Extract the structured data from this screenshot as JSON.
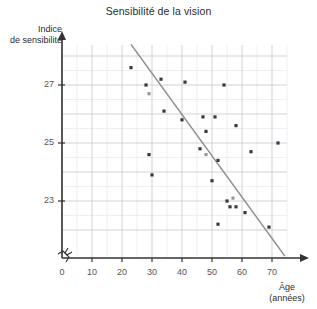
{
  "chart_data": {
    "type": "scatter",
    "title": "Sensibilité de la vision",
    "xlabel": "Âge",
    "xlabel_unit": "(années)",
    "ylabel_line1": "Indice",
    "ylabel_line2": "de sensibilité",
    "xlim": [
      0,
      75
    ],
    "ylim": [
      21.7,
      28.4
    ],
    "xticks": [
      0,
      10,
      20,
      30,
      40,
      50,
      60,
      70
    ],
    "xtick_labels": [
      "0",
      "10",
      "20",
      "30",
      "40",
      "50",
      "60",
      "70"
    ],
    "yticks": [
      23,
      25,
      27
    ],
    "ytick_labels": [
      "23",
      "25",
      "27"
    ],
    "grid": true,
    "grid_minor": true,
    "axis_break_x": true,
    "axis_break_y": true,
    "legend": null,
    "point_color": "#3a3a3a",
    "point_color_light": "#9a9a9a",
    "trendline_color": "#8c8c8c",
    "grid_major_color": "#c8c8cf",
    "grid_minor_color": "#e8e8ee",
    "axis_color": "#333333",
    "points": [
      {
        "x": 23,
        "y": 27.6
      },
      {
        "x": 28,
        "y": 27.0
      },
      {
        "x": 29,
        "y": 26.7,
        "light": true
      },
      {
        "x": 33,
        "y": 27.2
      },
      {
        "x": 34,
        "y": 26.1
      },
      {
        "x": 29,
        "y": 24.6
      },
      {
        "x": 30,
        "y": 23.9
      },
      {
        "x": 41,
        "y": 27.1
      },
      {
        "x": 40,
        "y": 25.8
      },
      {
        "x": 47,
        "y": 25.9
      },
      {
        "x": 48,
        "y": 25.4
      },
      {
        "x": 51,
        "y": 25.9
      },
      {
        "x": 54,
        "y": 27.0
      },
      {
        "x": 58,
        "y": 25.6
      },
      {
        "x": 46,
        "y": 24.8
      },
      {
        "x": 48,
        "y": 24.6,
        "light": true
      },
      {
        "x": 52,
        "y": 24.4
      },
      {
        "x": 63,
        "y": 24.7
      },
      {
        "x": 72,
        "y": 25.0
      },
      {
        "x": 50,
        "y": 23.7
      },
      {
        "x": 55,
        "y": 23.0
      },
      {
        "x": 57,
        "y": 23.1,
        "light": true
      },
      {
        "x": 56,
        "y": 22.8
      },
      {
        "x": 58,
        "y": 22.8
      },
      {
        "x": 61,
        "y": 22.6
      },
      {
        "x": 52,
        "y": 22.2
      },
      {
        "x": 69,
        "y": 22.1
      }
    ],
    "trendline": {
      "x_start": 23,
      "y_start": 28.4,
      "x_end": 74.3,
      "y_end": 21.1
    }
  }
}
